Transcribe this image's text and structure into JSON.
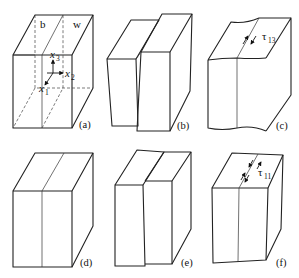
{
  "figure": {
    "panels": [
      {
        "id": "a",
        "caption": "(a)",
        "labels": {
          "left_region": "b",
          "right_region": "w",
          "axis1": "x",
          "axis1_sub": "1",
          "axis2": "x",
          "axis2_sub": "2",
          "axis3": "x",
          "axis3_sub": "3"
        }
      },
      {
        "id": "b",
        "caption": "(b)"
      },
      {
        "id": "c",
        "caption": "(c)",
        "labels": {
          "stress": "τ",
          "stress_sub": "13"
        }
      },
      {
        "id": "d",
        "caption": "(d)"
      },
      {
        "id": "e",
        "caption": "(e)"
      },
      {
        "id": "f",
        "caption": "(f)",
        "labels": {
          "stress": "τ",
          "stress_sub": "11"
        }
      }
    ]
  }
}
